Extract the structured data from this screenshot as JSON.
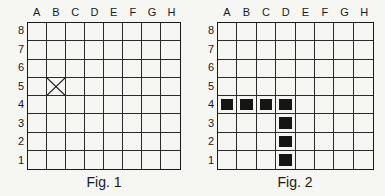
{
  "columns": [
    "A",
    "B",
    "C",
    "D",
    "E",
    "F",
    "G",
    "H"
  ],
  "rows": [
    "8",
    "7",
    "6",
    "5",
    "4",
    "3",
    "2",
    "1"
  ],
  "figures": [
    {
      "caption": "Fig. 1",
      "marks": [
        {
          "col": "B",
          "row": "5",
          "type": "x"
        }
      ]
    },
    {
      "caption": "Fig. 2",
      "marks": [
        {
          "col": "A",
          "row": "4",
          "type": "filled"
        },
        {
          "col": "B",
          "row": "4",
          "type": "filled"
        },
        {
          "col": "C",
          "row": "4",
          "type": "filled"
        },
        {
          "col": "D",
          "row": "4",
          "type": "filled"
        },
        {
          "col": "D",
          "row": "3",
          "type": "filled"
        },
        {
          "col": "D",
          "row": "2",
          "type": "filled"
        },
        {
          "col": "D",
          "row": "1",
          "type": "filled"
        }
      ]
    }
  ],
  "colors": {
    "line": "#1a1a1a",
    "fill": "#151515",
    "background": "#f6f6f3"
  }
}
